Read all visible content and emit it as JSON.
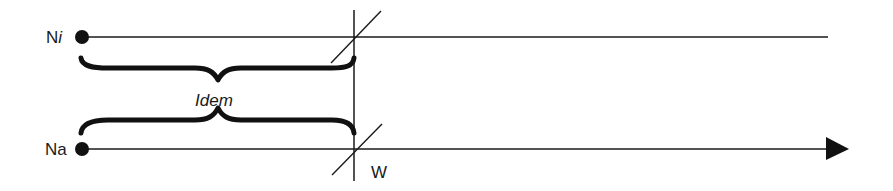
{
  "diagram": {
    "type": "timeline-comparison",
    "nodes": [
      {
        "id": "ni",
        "label_main": "N",
        "label_suffix": "i",
        "suffix_italic": true
      },
      {
        "id": "na",
        "label_main": "Na",
        "label_suffix": "",
        "suffix_italic": false
      }
    ],
    "brace_label": "Idem",
    "marker_label": "W",
    "colors": {
      "stroke": "#1a1a1a",
      "background": "#ffffff"
    }
  }
}
